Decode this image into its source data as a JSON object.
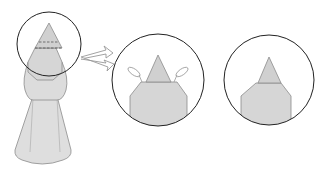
{
  "diagram": {
    "type": "origami-instruction",
    "colors": {
      "paper": "#dcdcdc",
      "paper_light": "#e4e4e4",
      "outline": "#8c8c8c",
      "circle": "#222222",
      "dash": "#555555",
      "arrow": "#999999",
      "background": "#ffffff"
    },
    "steps": [
      {
        "id": "figure",
        "description": "Full model with head region circled, two dashed fold lines across the cone"
      },
      {
        "id": "detail-1",
        "description": "Zoomed head: cone tip with two side flaps being folded (petal arrows)"
      },
      {
        "id": "detail-2",
        "description": "Zoomed head: result after folding, flaps tucked"
      }
    ],
    "arrow": {
      "from": "figure",
      "to": "detail-1",
      "style": "hollow"
    }
  }
}
